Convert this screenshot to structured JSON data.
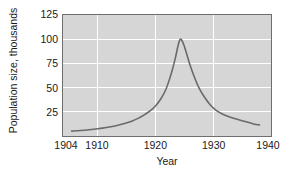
{
  "chart_data": {
    "type": "line",
    "title": "",
    "subtitle": "",
    "xlabel": "Year",
    "ylabel": "Population size, thousands",
    "xlim": [
      1904,
      1940
    ],
    "ylim": [
      0,
      125
    ],
    "xticks": [
      1904,
      1910,
      1920,
      1930,
      1940
    ],
    "xtick_labels": [
      "1904",
      "1910",
      "1920",
      "1930",
      "1940"
    ],
    "yticks": [
      25,
      50,
      75,
      100,
      125
    ],
    "ytick_labels": [
      "25",
      "50",
      "75",
      "100",
      "125"
    ],
    "grid": true,
    "grid_x_values": [
      1910,
      1920,
      1930
    ],
    "grid_y_values": [
      25,
      50,
      75,
      100
    ],
    "legend": null,
    "annotations": [],
    "series": [
      {
        "name": "Population size",
        "color": "#6a6a6a",
        "x": [
          1905.5,
          1907,
          1908.5,
          1910,
          1911.5,
          1913,
          1914.5,
          1916,
          1917,
          1918,
          1919,
          1920,
          1921,
          1921.8,
          1922.5,
          1923,
          1923.5,
          1923.9,
          1924.3,
          1924.8,
          1925.4,
          1926,
          1926.8,
          1927.6,
          1928.5,
          1929.5,
          1930.5,
          1931.5,
          1932.5,
          1934,
          1935.5,
          1937,
          1938
        ],
        "y": [
          5,
          5.6,
          6.4,
          7.4,
          8.7,
          10.4,
          12.6,
          15.6,
          18.2,
          21.5,
          25.6,
          31,
          39,
          48,
          60,
          70,
          82,
          93,
          100,
          96,
          85,
          73,
          60,
          49,
          40,
          32,
          26.5,
          23,
          20.5,
          17.5,
          15,
          12.5,
          11.5
        ]
      }
    ]
  },
  "plot_style": {
    "plot_background": "#d6d6d6",
    "plot_border_color": "#6e6e6e",
    "gridline_color": "#ffffff",
    "text_color": "#1a1a1a",
    "figure_background": "#ffffff"
  }
}
